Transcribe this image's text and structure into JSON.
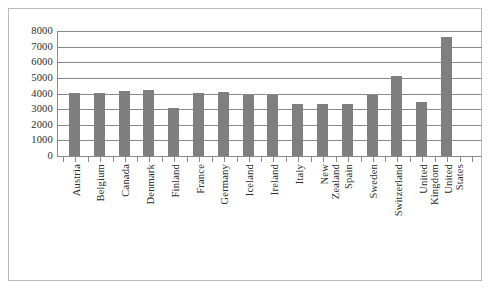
{
  "chart_data": {
    "type": "bar",
    "title": "",
    "subtitle": "",
    "xlabel": "",
    "ylabel": "",
    "ylim": [
      0,
      8000
    ],
    "ytick_values": [
      0,
      1000,
      2000,
      3000,
      4000,
      5000,
      6000,
      7000,
      8000
    ],
    "ytick_labels": [
      "0",
      "1000",
      "2000",
      "3000",
      "4000",
      "5000",
      "6000",
      "7000",
      "8000"
    ],
    "grid": "horizontal",
    "legend": "none",
    "bar_color": "#7f7f7f",
    "axis_color": "#8a8a8a",
    "categories": [
      "Austria",
      "Belgium",
      "Canada",
      "Denmark",
      "Finland",
      "France",
      "Germany",
      "Iceland",
      "Ireland",
      "Italy",
      "New Zealand",
      "Spain",
      "Sweden",
      "Switzerland",
      "United Kingdom",
      "United States"
    ],
    "values": [
      4050,
      4020,
      4160,
      4200,
      3050,
      4060,
      4100,
      3900,
      3880,
      3340,
      3340,
      3340,
      3880,
      5150,
      3480,
      7620
    ],
    "series": [
      {
        "name": "",
        "values": [
          4050,
          4020,
          4160,
          4200,
          3050,
          4060,
          4100,
          3900,
          3880,
          3340,
          3340,
          3340,
          3880,
          5150,
          3480,
          7620
        ]
      }
    ]
  }
}
